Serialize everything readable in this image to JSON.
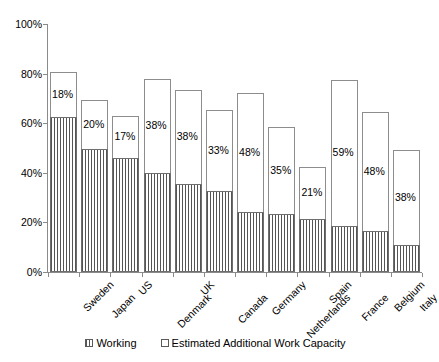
{
  "chart_data": {
    "type": "bar",
    "subtype": "stacked",
    "title": "",
    "xlabel": "",
    "ylabel": "",
    "ylim": [
      0,
      100
    ],
    "yticks": [
      "0%",
      "20%",
      "40%",
      "60%",
      "80%",
      "100%"
    ],
    "ytick_values": [
      0,
      20,
      40,
      60,
      80,
      100
    ],
    "grid": false,
    "legend_position": "bottom",
    "categories": [
      "Sweden",
      "Japan",
      "US",
      "Denmark",
      "UK",
      "Canada",
      "Germany",
      "Netherlands",
      "Spain",
      "France",
      "Belgium",
      "Italy"
    ],
    "series": [
      {
        "name": "Working",
        "values": [
          62.5,
          49.5,
          46.0,
          40.0,
          35.5,
          32.5,
          24.0,
          23.5,
          21.5,
          18.5,
          16.5,
          11.0
        ]
      },
      {
        "name": "Estimated Additional Work Capacity",
        "values": [
          18.0,
          20.0,
          17.0,
          38.0,
          38.0,
          33.0,
          48.0,
          35.0,
          21.0,
          59.0,
          48.0,
          38.0
        ]
      }
    ],
    "totals": [
      80.5,
      69.5,
      63.0,
      78.0,
      73.5,
      65.5,
      72.0,
      58.5,
      42.5,
      77.5,
      64.5,
      49.0
    ],
    "data_labels": [
      "18%",
      "20%",
      "17%",
      "38%",
      "38%",
      "33%",
      "48%",
      "35%",
      "21%",
      "59%",
      "48%",
      "38%"
    ],
    "data_label_note": "Value labels are placed inside the Estimated Additional Work Capacity segment"
  },
  "legend": {
    "entries": [
      {
        "label": "Working",
        "marker": "hatched-square",
        "color": "#555555"
      },
      {
        "label": "Estimated Additional Work Capacity",
        "marker": "white-square",
        "color": "#ffffff"
      }
    ]
  },
  "axis": {
    "y_labels": [
      "100%",
      "80%",
      "60%",
      "40%",
      "20%",
      "0%"
    ]
  },
  "colors": {
    "axis": "#8a8a8a",
    "bar_outline": "#8d8d8d",
    "working_hatch": "#555555",
    "background": "#ffffff",
    "text": "#000000"
  }
}
